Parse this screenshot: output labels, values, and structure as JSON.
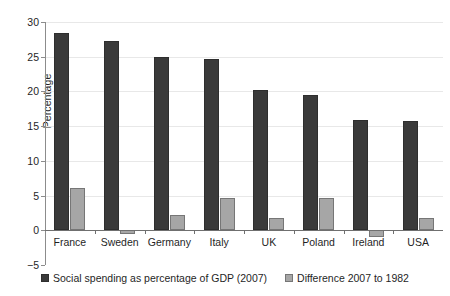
{
  "chart_data": {
    "type": "bar",
    "title": "",
    "subtitle": "",
    "xlabel": "",
    "ylabel": "Percentage",
    "ylim": [
      -5,
      30
    ],
    "ytick_step": 5,
    "yticks": [
      "30",
      "25",
      "20",
      "15",
      "10",
      "5",
      "0",
      "-5"
    ],
    "ytick_values": [
      30,
      25,
      20,
      15,
      10,
      5,
      0,
      -5
    ],
    "grid": true,
    "grid_axis": "y",
    "legend_position": "bottom-center",
    "categories": [
      "France",
      "Sweden",
      "Germany",
      "Italy",
      "UK",
      "Poland",
      "Ireland",
      "USA"
    ],
    "series": [
      {
        "name": "Social spending as percentage of GDP (2007)",
        "color": "#3a3a3a",
        "values": [
          28.4,
          27.3,
          25.0,
          24.7,
          20.2,
          19.5,
          15.9,
          15.7
        ]
      },
      {
        "name": "Difference 2007 to 1982",
        "color": "#a6a6a6",
        "values": [
          6.1,
          -0.6,
          2.2,
          4.7,
          1.7,
          4.6,
          -0.9,
          1.8
        ]
      }
    ]
  },
  "legend": {
    "items": [
      {
        "label": "Social spending as percentage of GDP (2007)",
        "swatch": "swatch-primary"
      },
      {
        "label": "Difference 2007 to 1982",
        "swatch": "swatch-secondary"
      }
    ]
  },
  "axes": {
    "y_title": "Percentage"
  }
}
